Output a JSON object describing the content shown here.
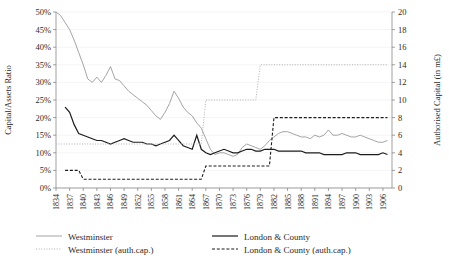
{
  "chart_data": {
    "type": "line",
    "title": "",
    "xlabel": "",
    "ylabel": "Capital/Assets Ratio",
    "y2label": "Authorised Capital (in m£)",
    "grid": true,
    "legend_position": "bottom",
    "ylim": [
      0,
      50
    ],
    "y2lim": [
      0,
      20
    ],
    "yticks": [
      "0%",
      "5%",
      "10%",
      "15%",
      "20%",
      "25%",
      "30%",
      "35%",
      "40%",
      "45%",
      "50%"
    ],
    "ytick_values": [
      0,
      5,
      10,
      15,
      20,
      25,
      30,
      35,
      40,
      45,
      50
    ],
    "y2ticks": [
      "0",
      "2",
      "4",
      "6",
      "8",
      "10",
      "12",
      "14",
      "16",
      "18",
      "20"
    ],
    "y2tick_values": [
      0,
      2,
      4,
      6,
      8,
      10,
      12,
      14,
      16,
      18,
      20
    ],
    "xlim": [
      1834,
      1908
    ],
    "xtick_labels": [
      "1834",
      "1837",
      "1840",
      "1843",
      "1846",
      "1849",
      "1852",
      "1855",
      "1858",
      "1861",
      "1864",
      "1867",
      "1870",
      "1873",
      "1876",
      "1879",
      "1882",
      "1885",
      "1888",
      "1891",
      "1894",
      "1897",
      "1900",
      "1903",
      "1906"
    ],
    "xtick_values": [
      1834,
      1837,
      1840,
      1843,
      1846,
      1849,
      1852,
      1855,
      1858,
      1861,
      1864,
      1867,
      1870,
      1873,
      1876,
      1879,
      1882,
      1885,
      1888,
      1891,
      1894,
      1897,
      1900,
      1903,
      1906
    ],
    "series": [
      {
        "name": "Westminster",
        "key": "westminster_ratio",
        "axis": "left",
        "style": "solid",
        "color": "#9a9a9a",
        "width": 0.9,
        "x": [
          1834,
          1835,
          1836,
          1837,
          1838,
          1839,
          1840,
          1841,
          1842,
          1843,
          1844,
          1845,
          1846,
          1847,
          1848,
          1849,
          1850,
          1851,
          1852,
          1853,
          1854,
          1855,
          1856,
          1857,
          1858,
          1859,
          1860,
          1861,
          1862,
          1863,
          1864,
          1865,
          1866,
          1867,
          1868,
          1869,
          1870,
          1871,
          1872,
          1873,
          1874,
          1875,
          1876,
          1877,
          1878,
          1879,
          1880,
          1881,
          1882,
          1883,
          1884,
          1885,
          1886,
          1887,
          1888,
          1889,
          1890,
          1891,
          1892,
          1893,
          1894,
          1895,
          1896,
          1897,
          1898,
          1899,
          1900,
          1901,
          1902,
          1903,
          1904,
          1905,
          1906,
          1907
        ],
        "y": [
          50.0,
          49.0,
          47.0,
          45.0,
          42.0,
          38.5,
          35.0,
          31.0,
          30.0,
          31.5,
          30.0,
          32.0,
          34.5,
          31.0,
          30.5,
          29.0,
          27.5,
          26.5,
          25.5,
          24.5,
          23.5,
          22.0,
          20.5,
          19.5,
          21.5,
          24.0,
          27.5,
          25.5,
          23.0,
          21.5,
          20.5,
          18.5,
          17.0,
          14.0,
          11.0,
          9.5,
          10.0,
          10.0,
          9.5,
          9.0,
          9.5,
          11.5,
          12.5,
          12.0,
          11.5,
          11.0,
          12.0,
          13.5,
          14.5,
          15.5,
          16.0,
          16.0,
          15.5,
          15.0,
          14.5,
          14.5,
          14.0,
          15.0,
          14.5,
          15.0,
          16.5,
          15.0,
          15.0,
          15.5,
          15.0,
          14.5,
          14.5,
          15.0,
          14.5,
          14.0,
          13.5,
          13.0,
          13.0,
          13.5
        ]
      },
      {
        "name": "London & County",
        "key": "london_county_ratio",
        "axis": "left",
        "style": "solid",
        "color": "#1c1c1c",
        "width": 1.2,
        "x": [
          1836,
          1837,
          1838,
          1839,
          1840,
          1841,
          1842,
          1843,
          1844,
          1845,
          1846,
          1847,
          1848,
          1849,
          1850,
          1851,
          1852,
          1853,
          1854,
          1855,
          1856,
          1857,
          1858,
          1859,
          1860,
          1861,
          1862,
          1863,
          1864,
          1865,
          1866,
          1867,
          1868,
          1869,
          1870,
          1871,
          1872,
          1873,
          1874,
          1875,
          1876,
          1877,
          1878,
          1879,
          1880,
          1881,
          1882,
          1883,
          1884,
          1885,
          1886,
          1887,
          1888,
          1889,
          1890,
          1891,
          1892,
          1893,
          1894,
          1895,
          1896,
          1897,
          1898,
          1899,
          1900,
          1901,
          1902,
          1903,
          1904,
          1905,
          1906,
          1907
        ],
        "y": [
          23.0,
          21.5,
          18.0,
          15.5,
          15.0,
          14.5,
          14.0,
          13.5,
          13.5,
          13.0,
          12.5,
          13.0,
          13.5,
          14.0,
          13.5,
          13.0,
          13.0,
          13.0,
          12.5,
          12.5,
          12.0,
          12.5,
          13.0,
          13.5,
          15.0,
          13.5,
          12.0,
          11.5,
          11.0,
          15.0,
          11.0,
          10.0,
          9.5,
          10.0,
          10.5,
          11.0,
          10.5,
          10.0,
          10.0,
          10.5,
          11.0,
          11.0,
          10.5,
          10.5,
          11.0,
          11.0,
          11.0,
          10.5,
          10.5,
          10.5,
          10.5,
          10.5,
          10.5,
          10.0,
          10.0,
          10.0,
          10.0,
          9.5,
          9.5,
          9.5,
          9.5,
          9.5,
          10.0,
          10.0,
          10.0,
          9.5,
          9.5,
          9.5,
          9.5,
          9.5,
          10.0,
          9.5
        ]
      },
      {
        "name": "Westminster (auth.cap.)",
        "key": "westminster_authcap",
        "axis": "right",
        "style": "dotted",
        "color": "#b0b0b0",
        "width": 1.0,
        "x": [
          1834,
          1835,
          1836,
          1837,
          1838,
          1839,
          1840,
          1841,
          1842,
          1843,
          1844,
          1845,
          1846,
          1847,
          1848,
          1849,
          1850,
          1851,
          1852,
          1853,
          1854,
          1855,
          1856,
          1857,
          1858,
          1859,
          1860,
          1861,
          1862,
          1863,
          1864,
          1865,
          1866,
          1867,
          1868,
          1869,
          1870,
          1871,
          1872,
          1873,
          1874,
          1875,
          1876,
          1877,
          1878,
          1879,
          1880,
          1881,
          1882,
          1883,
          1884,
          1885,
          1886,
          1887,
          1888,
          1889,
          1890,
          1891,
          1892,
          1893,
          1894,
          1895,
          1896,
          1897,
          1898,
          1899,
          1900,
          1901,
          1902,
          1903,
          1904,
          1905,
          1906,
          1907
        ],
        "y": [
          5.0,
          5.0,
          5.0,
          5.0,
          5.0,
          5.0,
          5.0,
          5.0,
          5.0,
          5.0,
          5.0,
          5.0,
          5.0,
          5.0,
          5.0,
          5.0,
          5.0,
          5.0,
          5.0,
          5.0,
          5.0,
          5.0,
          5.0,
          5.0,
          5.0,
          5.0,
          5.0,
          5.0,
          5.0,
          5.0,
          5.0,
          5.0,
          5.0,
          10.0,
          10.0,
          10.0,
          10.0,
          10.0,
          10.0,
          10.0,
          10.0,
          10.0,
          10.0,
          10.0,
          10.0,
          14.0,
          14.0,
          14.0,
          14.0,
          14.0,
          14.0,
          14.0,
          14.0,
          14.0,
          14.0,
          14.0,
          14.0,
          14.0,
          14.0,
          14.0,
          14.0,
          14.0,
          14.0,
          14.0,
          14.0,
          14.0,
          14.0,
          14.0,
          14.0,
          14.0,
          14.0,
          14.0,
          14.0,
          14.0
        ]
      },
      {
        "name": "London & County (auth.cap.)",
        "key": "london_county_authcap",
        "axis": "right",
        "style": "dashed",
        "color": "#1c1c1c",
        "width": 1.1,
        "x": [
          1836,
          1837,
          1838,
          1839,
          1840,
          1841,
          1842,
          1843,
          1844,
          1845,
          1846,
          1847,
          1848,
          1849,
          1850,
          1851,
          1852,
          1853,
          1854,
          1855,
          1856,
          1857,
          1858,
          1859,
          1860,
          1861,
          1862,
          1863,
          1864,
          1865,
          1866,
          1867,
          1868,
          1869,
          1870,
          1871,
          1872,
          1873,
          1874,
          1875,
          1876,
          1877,
          1878,
          1879,
          1880,
          1881,
          1882,
          1883,
          1884,
          1885,
          1886,
          1887,
          1888,
          1889,
          1890,
          1891,
          1892,
          1893,
          1894,
          1895,
          1896,
          1897,
          1898,
          1899,
          1900,
          1901,
          1902,
          1903,
          1904,
          1905,
          1906,
          1907
        ],
        "y": [
          2.0,
          2.0,
          2.0,
          2.0,
          1.0,
          1.0,
          1.0,
          1.0,
          1.0,
          1.0,
          1.0,
          1.0,
          1.0,
          1.0,
          1.0,
          1.0,
          1.0,
          1.0,
          1.0,
          1.0,
          1.0,
          1.0,
          1.0,
          1.0,
          1.0,
          1.0,
          1.0,
          1.0,
          1.0,
          1.0,
          1.0,
          2.5,
          2.5,
          2.5,
          2.5,
          2.5,
          2.5,
          2.5,
          2.5,
          2.5,
          2.5,
          2.5,
          2.5,
          2.5,
          2.5,
          2.5,
          8.0,
          8.0,
          8.0,
          8.0,
          8.0,
          8.0,
          8.0,
          8.0,
          8.0,
          8.0,
          8.0,
          8.0,
          8.0,
          8.0,
          8.0,
          8.0,
          8.0,
          8.0,
          8.0,
          8.0,
          8.0,
          8.0,
          8.0,
          8.0,
          8.0,
          8.0
        ]
      }
    ]
  },
  "legend": {
    "entries": [
      {
        "label": "Westminster",
        "style": "solid",
        "color": "#9a9a9a",
        "width": 0.9
      },
      {
        "label": "London & County",
        "style": "solid",
        "color": "#1c1c1c",
        "width": 1.2
      },
      {
        "label": "Westminster (auth.cap.)",
        "style": "dotted",
        "color": "#b0b0b0",
        "width": 1.0
      },
      {
        "label": "London & County (auth.cap.)",
        "style": "dashed",
        "color": "#1c1c1c",
        "width": 1.1
      }
    ]
  },
  "colors": {
    "westminster": "#9a9a9a",
    "westminster_authcap": "#b0b0b0",
    "london_county": "#1c1c1c",
    "london_county_authcap": "#1c1c1c",
    "grid": "#ededed",
    "axis": "#7a7a7a",
    "text": "#2b2b2b",
    "background": "#ffffff"
  }
}
